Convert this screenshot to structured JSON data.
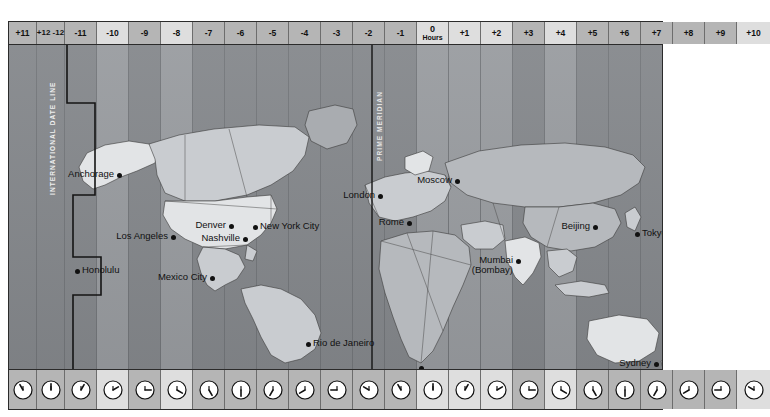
{
  "map": {
    "title": "World Time Zones",
    "prime_meridian_label": "PRIME MERIDIAN",
    "date_line_label": "INTERNATIONAL DATE LINE",
    "legend": {
      "swatch_name": "nonstandard-time-swatch",
      "label": "Nonstandard time"
    },
    "colors": {
      "band_light": "#999ca0",
      "band_dark": "#85888c",
      "header_light": "#dedede",
      "header_dark": "#b5b5b5",
      "land": "#c9ccd0",
      "land_light": "#e2e4e6",
      "frame": "#2b2b2b",
      "marker": "#111111",
      "legend_bg": "#ffffff"
    },
    "zones": [
      {
        "label": "+11",
        "width": 28,
        "tone": "dark",
        "clock_hour": 11,
        "clock_minute": 0
      },
      {
        "label": "+12 -12",
        "width": 28,
        "tone": "dark",
        "split": true,
        "clock_hour": 12,
        "clock_minute": 0
      },
      {
        "label": "-11",
        "width": 32,
        "tone": "dark",
        "clock_hour": 1,
        "clock_minute": 0
      },
      {
        "label": "-10",
        "width": 32,
        "tone": "light",
        "clock_hour": 2,
        "clock_minute": 0
      },
      {
        "label": "-9",
        "width": 32,
        "tone": "dark",
        "clock_hour": 3,
        "clock_minute": 0
      },
      {
        "label": "-8",
        "width": 32,
        "tone": "light",
        "clock_hour": 4,
        "clock_minute": 0
      },
      {
        "label": "-7",
        "width": 32,
        "tone": "dark",
        "clock_hour": 5,
        "clock_minute": 0
      },
      {
        "label": "-6",
        "width": 32,
        "tone": "dark",
        "clock_hour": 6,
        "clock_minute": 0
      },
      {
        "label": "-5",
        "width": 32,
        "tone": "dark",
        "clock_hour": 7,
        "clock_minute": 0
      },
      {
        "label": "-4",
        "width": 32,
        "tone": "dark",
        "clock_hour": 8,
        "clock_minute": 0
      },
      {
        "label": "-3",
        "width": 32,
        "tone": "dark",
        "clock_hour": 9,
        "clock_minute": 0
      },
      {
        "label": "-2",
        "width": 32,
        "tone": "dark",
        "clock_hour": 10,
        "clock_minute": 0
      },
      {
        "label": "-1",
        "width": 32,
        "tone": "dark",
        "clock_hour": 11,
        "clock_minute": 0
      },
      {
        "label": "0",
        "sub": "Hours",
        "width": 32,
        "tone": "light",
        "zero": true,
        "clock_hour": 12,
        "clock_minute": 0
      },
      {
        "label": "+1",
        "width": 32,
        "tone": "light",
        "clock_hour": 1,
        "clock_minute": 0
      },
      {
        "label": "+2",
        "width": 32,
        "tone": "light",
        "clock_hour": 2,
        "clock_minute": 0
      },
      {
        "label": "+3",
        "width": 32,
        "tone": "dark",
        "clock_hour": 3,
        "clock_minute": 0
      },
      {
        "label": "+4",
        "width": 32,
        "tone": "light",
        "clock_hour": 4,
        "clock_minute": 0
      },
      {
        "label": "+5",
        "width": 32,
        "tone": "dark",
        "clock_hour": 5,
        "clock_minute": 0
      },
      {
        "label": "+6",
        "width": 32,
        "tone": "dark",
        "clock_hour": 6,
        "clock_minute": 0
      },
      {
        "label": "+7",
        "width": 32,
        "tone": "dark",
        "clock_hour": 7,
        "clock_minute": 0
      },
      {
        "label": "+8",
        "width": 32,
        "tone": "dark",
        "clock_hour": 8,
        "clock_minute": 0
      },
      {
        "label": "+9",
        "width": 32,
        "tone": "dark",
        "clock_hour": 9,
        "clock_minute": 0
      },
      {
        "label": "+10",
        "width": 33,
        "tone": "light",
        "clock_hour": 10,
        "clock_minute": 0
      }
    ],
    "cities": [
      {
        "name": "Anchorage",
        "x": 110,
        "y": 130,
        "anchor": "lft"
      },
      {
        "name": "Honolulu",
        "x": 68,
        "y": 226,
        "anchor": "rgt"
      },
      {
        "name": "Los Angeles",
        "x": 164,
        "y": 192,
        "anchor": "lft"
      },
      {
        "name": "Denver",
        "x": 222,
        "y": 181,
        "anchor": "lft"
      },
      {
        "name": "Nashville",
        "x": 236,
        "y": 194,
        "anchor": "lft"
      },
      {
        "name": "New York City",
        "x": 246,
        "y": 182,
        "anchor": "rgt"
      },
      {
        "name": "Mexico City",
        "x": 203,
        "y": 233,
        "anchor": "lft"
      },
      {
        "name": "Rio de Janeiro",
        "x": 299,
        "y": 299,
        "anchor": "rgt"
      },
      {
        "name": "London",
        "x": 371,
        "y": 151,
        "anchor": "lft"
      },
      {
        "name": "Rome",
        "x": 400,
        "y": 178,
        "anchor": "lft"
      },
      {
        "name": "Moscow",
        "x": 448,
        "y": 136,
        "anchor": "lft"
      },
      {
        "name": "Cape Town",
        "x": 412,
        "y": 323,
        "anchor": "btm"
      },
      {
        "name": "Mumbai",
        "x": 509,
        "y": 216,
        "anchor": "lft",
        "line2": "(Bombay)"
      },
      {
        "name": "Beijing",
        "x": 586,
        "y": 182,
        "anchor": "lft"
      },
      {
        "name": "Tokyo",
        "x": 628,
        "y": 189,
        "anchor": "rgt"
      },
      {
        "name": "Sydney",
        "x": 647,
        "y": 319,
        "anchor": "lft"
      }
    ]
  }
}
